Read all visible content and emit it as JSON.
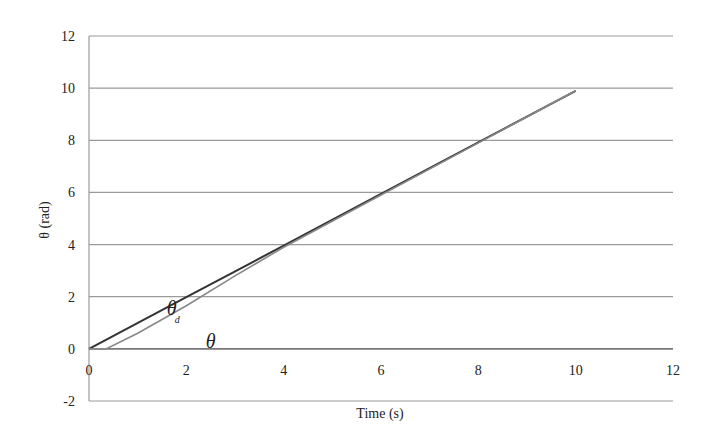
{
  "chart_data": {
    "type": "line",
    "title": "",
    "xlabel": "Time (s)",
    "ylabel": "θ (rad)",
    "xlim": [
      0,
      12
    ],
    "ylim": [
      -2,
      12
    ],
    "x_ticks": [
      0,
      2,
      4,
      6,
      8,
      10,
      12
    ],
    "y_ticks": [
      -2,
      0,
      2,
      4,
      6,
      8,
      10,
      12
    ],
    "grid": {
      "horizontal": true,
      "vertical": false
    },
    "legend": null,
    "series": [
      {
        "name": "θd",
        "color": "#333333",
        "x": [
          0,
          2,
          4,
          6,
          8,
          10
        ],
        "y": [
          0,
          1.98,
          3.96,
          5.94,
          7.92,
          9.9
        ]
      },
      {
        "name": "θ",
        "color": "#888888",
        "x": [
          0,
          0.35,
          1,
          2,
          3,
          4,
          6,
          8,
          10
        ],
        "y": [
          0,
          0,
          0.6,
          1.65,
          2.8,
          3.9,
          5.9,
          7.9,
          9.9
        ]
      }
    ],
    "annotations": [
      {
        "text": "θ",
        "subscript": "d",
        "x": 1.6,
        "y": 1.3
      },
      {
        "text": "θ",
        "subscript": "",
        "x": 2.4,
        "y": 0.05
      }
    ]
  }
}
